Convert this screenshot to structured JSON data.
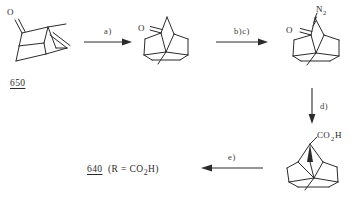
{
  "scheme": {
    "title": "Synthetic scheme from compound 650 to 640",
    "width": 350,
    "height": 205,
    "line_color": "#2b2b2b",
    "background": "#ffffff"
  },
  "structures": [
    {
      "id": "structure-650",
      "name": "bicyclic-enone-650",
      "oxygen_label": "O",
      "description": "bicyclo[2.2.2]octanone bearing exocyclic methylene and methyl",
      "compound_number": "650"
    },
    {
      "id": "structure-ketone",
      "name": "bicyclic-ketone-intermediate",
      "oxygen_label": "O",
      "description": "saturated bicyclo[2.2.2]octanone with methyl group"
    },
    {
      "id": "structure-diazo",
      "name": "alpha-diazo-ketone",
      "oxygen_label": "O",
      "diazo_label": "N",
      "diazo_sub": "2",
      "description": "alpha-diazo bicyclic ketone"
    },
    {
      "id": "structure-acid",
      "name": "bicyclic-carboxylic-acid",
      "acid_label_c": "CO",
      "acid_label_sub": "2",
      "acid_label_h": "H",
      "description": "bicyclo[2.2.2]octane carboxylic acid with methyl"
    }
  ],
  "arrows": [
    {
      "id": "arrow-a",
      "label": "a)",
      "direction": "right"
    },
    {
      "id": "arrow-bc",
      "label": "b)c)",
      "direction": "right"
    },
    {
      "id": "arrow-d",
      "label": "d)",
      "direction": "down"
    },
    {
      "id": "arrow-e",
      "label": "e)",
      "direction": "left"
    }
  ],
  "labels": {
    "start_compound": "650",
    "product_number": "640",
    "product_caption_open": "(R  =  CO",
    "product_caption_sub": "2",
    "product_caption_close": "H)"
  }
}
